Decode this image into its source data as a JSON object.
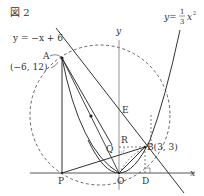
{
  "figure": {
    "title": "図 2",
    "labels": {
      "line_eq": "y = −x + 6",
      "parabola_eq_prefix": "y =",
      "parabola_num": "1",
      "parabola_den": "3",
      "parabola_var": "x",
      "parabola_exp": "2",
      "y_axis": "y",
      "x_axis": "x",
      "A": "A",
      "A_coord": "(−6, 12)",
      "B": "B(3, 3)",
      "E": "E",
      "R": "R",
      "Q": "Q",
      "P": "P",
      "O": "O",
      "D": "D"
    },
    "colors": {
      "ink": "#333333",
      "axis": "#888888",
      "dashed": "#555555",
      "background": "#ffffff"
    },
    "points": {
      "O": [
        0,
        0
      ],
      "A": [
        -6,
        12
      ],
      "B": [
        3,
        3
      ],
      "E": [
        0,
        6
      ],
      "R": [
        0,
        3
      ],
      "D": [
        3,
        0
      ],
      "P": [
        -6,
        0
      ]
    }
  }
}
